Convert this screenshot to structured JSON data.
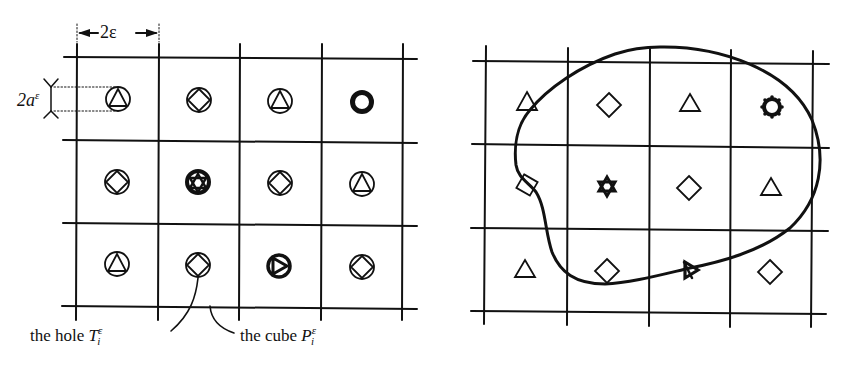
{
  "figure": {
    "left_panel": {
      "name": "periodic perforated domain",
      "dimension_labels": {
        "cell_width": "2ε",
        "hole_diameter_base": "2a",
        "hole_diameter_sup": "ε"
      },
      "callouts": {
        "hole": {
          "prefix": "the hole ",
          "symbol": "T",
          "sub": "i",
          "sup": "ε"
        },
        "cube": {
          "prefix": "the cube ",
          "symbol": "P",
          "sub": "i",
          "sup": "ε"
        }
      },
      "grid": {
        "columns": 4,
        "rows": 3
      },
      "cells": [
        [
          "circle-triangle",
          "circle-diamond",
          "circle-triangle",
          "thick-ring"
        ],
        [
          "circle-diamond",
          "circle-star",
          "circle-diamond",
          "circle-triangle"
        ],
        [
          "circle-triangle",
          "circle-diamond",
          "circle-right-triangle",
          "circle-diamond"
        ]
      ]
    },
    "right_panel": {
      "name": "non-periodic holes inside closed curve",
      "grid": {
        "columns": 4,
        "rows": 3
      },
      "cells": [
        [
          "triangle",
          "diamond",
          "triangle",
          "octagon-gear"
        ],
        [
          "diamond",
          "star-of-david",
          "diamond",
          "triangle"
        ],
        [
          "triangle",
          "diamond",
          "right-triangle-bold",
          "diamond"
        ]
      ],
      "boundary": "closed smooth curve"
    },
    "colors": {
      "ink": "#111111",
      "background": "#ffffff"
    }
  }
}
